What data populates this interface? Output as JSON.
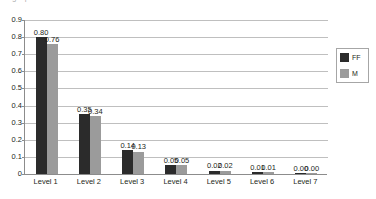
{
  "chart_data": {
    "type": "bar",
    "title": "",
    "xlabel": "",
    "ylabel": "",
    "ylim": [
      0,
      0.9
    ],
    "grid": true,
    "legend_position": "right",
    "categories": [
      "Level 1",
      "Level 2",
      "Level 3",
      "Level 4",
      "Level 5",
      "Level 6",
      "Level 7"
    ],
    "yticks": [
      "0",
      "0.1",
      "0.2",
      "0.3",
      "0.4",
      "0.5",
      "0.6",
      "0.7",
      "0.8",
      "0.9"
    ],
    "ytick_values": [
      0,
      0.1,
      0.2,
      0.3,
      0.4,
      0.5,
      0.6,
      0.7,
      0.8,
      0.9
    ],
    "series": [
      {
        "name": "FF",
        "color": "#2b2b2b",
        "values": [
          0.8,
          0.35,
          0.14,
          0.05,
          0.02,
          0.01,
          0.0
        ],
        "labels": [
          "0.80",
          "0.35",
          "0.14",
          "0.05",
          "0.02",
          "0.01",
          "0.00"
        ]
      },
      {
        "name": "M",
        "color": "#9b9b9b",
        "values": [
          0.76,
          0.34,
          0.13,
          0.05,
          0.02,
          0.01,
          0.0
        ],
        "labels": [
          "0.76",
          "0.34",
          "0.13",
          "0.05",
          "0.02",
          "0.01",
          "0.00"
        ]
      }
    ]
  },
  "legend": {
    "items": [
      {
        "label": "FF",
        "color": "#2b2b2b"
      },
      {
        "label": "M",
        "color": "#9b9b9b"
      }
    ]
  },
  "title_clip": "graph title"
}
